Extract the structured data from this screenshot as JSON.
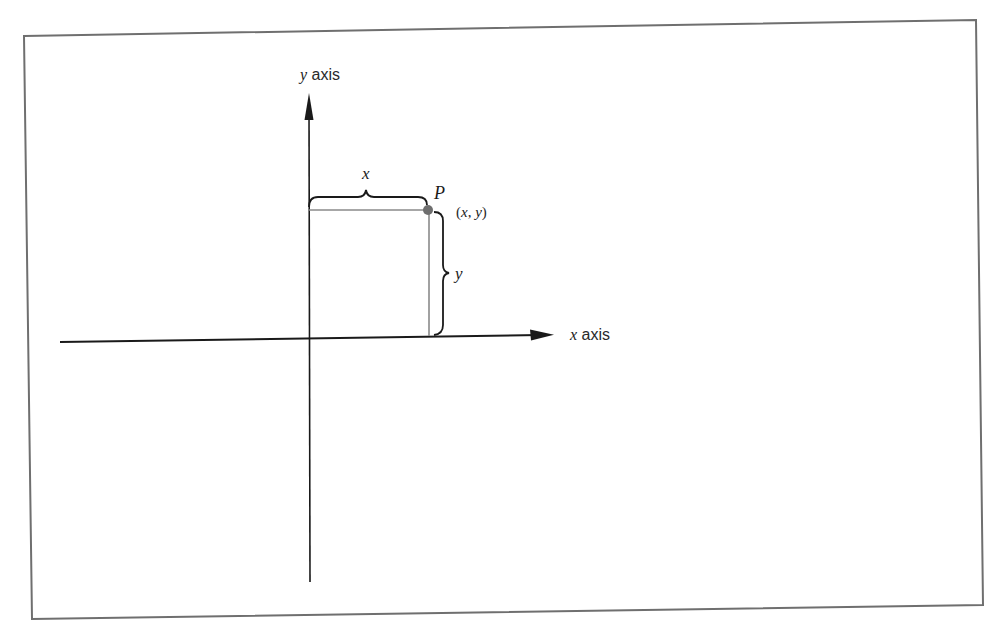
{
  "figure": {
    "type": "cartesian-coordinate-diagram",
    "y_axis_label": {
      "variable": "y",
      "word": " axis"
    },
    "x_axis_label": {
      "variable": "x",
      "word": " axis"
    },
    "point": {
      "name": "P",
      "coordinates_open": "(",
      "coordinates_x": "x",
      "coordinates_sep": ", ",
      "coordinates_y": "y",
      "coordinates_close": ")"
    },
    "horizontal_distance_label": "x",
    "vertical_distance_label": "y",
    "colors": {
      "axes": "#1a1a1a",
      "projection_lines": "#8a8a8a",
      "point": "#6e6e6e",
      "frame": "#6f6f6f"
    }
  }
}
